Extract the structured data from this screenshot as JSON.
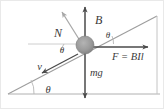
{
  "figure": {
    "kind": "physics-free-body-diagram",
    "background_color": "#ffffff",
    "line_color": "#8a8a8a",
    "arrow_color": "#4a4a4a",
    "label_color": "#3a3a3a",
    "block_fill": "#9a9a9a",
    "incline_angle_deg": 27,
    "labels": {
      "normal_force": "N",
      "magnetic_field": "B",
      "weight": "mg",
      "force": "F = BIl",
      "velocity": "v",
      "angle_top_right": "θ",
      "angle_center_left": "θ",
      "angle_base": "θ"
    },
    "vectors": [
      {
        "name": "normal-force",
        "label": "N",
        "direction": "up-left perpendicular to incline"
      },
      {
        "name": "magnetic-field",
        "label": "B",
        "direction": "vertically up"
      },
      {
        "name": "weight",
        "label": "mg",
        "direction": "vertically down"
      },
      {
        "name": "applied-force",
        "label": "F = BIl",
        "direction": "horizontally right"
      },
      {
        "name": "velocity",
        "label": "v",
        "direction": "down-left along incline"
      }
    ]
  }
}
